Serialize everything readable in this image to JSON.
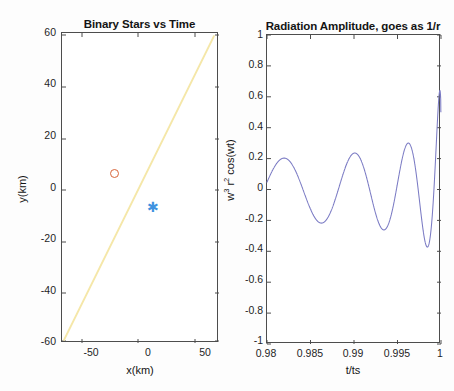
{
  "figure": {
    "background": "#ffffff",
    "frame_color": "#4d4d4d"
  },
  "panels": [
    {
      "id": "binary-stars",
      "title": "Binary Stars vs Time",
      "xlabel": "x(km)",
      "ylabel": "y(km)",
      "xticks": [
        "-50",
        "0",
        "50"
      ],
      "xtick_values": [
        -50,
        0,
        50
      ],
      "yticks": [
        "60",
        "40",
        "20",
        "0",
        "-20",
        "-40",
        "-60"
      ],
      "ytick_values": [
        60,
        40,
        20,
        0,
        -20,
        -40,
        -60
      ],
      "xlim": [
        -60,
        58
      ],
      "ylim": [
        -60,
        60
      ],
      "series": [
        {
          "name": "orbit-trace",
          "type": "line",
          "color": "#f5e7a8"
        },
        {
          "name": "star-1",
          "type": "marker",
          "marker": "circle",
          "color": "#d8653a",
          "x": -15,
          "y": 6
        },
        {
          "name": "star-2",
          "type": "marker",
          "marker": "asterisk",
          "color": "#3f93e0",
          "x": 14,
          "y": -6
        }
      ]
    },
    {
      "id": "radiation-amplitude",
      "title": "Radiation Amplitude, goes as 1/r",
      "xlabel": "t/ts",
      "ylabel_parts": {
        "base1": "w",
        "exp1": "3",
        "base2": " r",
        "exp2": "2",
        "rest": " cos(wt)"
      },
      "ylabel": "w3 r2 cos(wt)",
      "xticks": [
        "0.98",
        "0.985",
        "0.99",
        "0.995",
        "1"
      ],
      "xtick_values": [
        0.98,
        0.985,
        0.99,
        0.995,
        1.0
      ],
      "yticks": [
        "1",
        "0.8",
        "0.6",
        "0.4",
        "0.2",
        "0",
        "-0.2",
        "-0.4",
        "-0.6",
        "-0.8",
        "-1"
      ],
      "ytick_values": [
        1,
        0.8,
        0.6,
        0.4,
        0.2,
        0,
        -0.2,
        -0.4,
        -0.6,
        -0.8,
        -1
      ],
      "xlim": [
        0.98,
        1.0
      ],
      "ylim": [
        -1,
        1
      ],
      "series": [
        {
          "name": "chirp-waveform",
          "type": "line",
          "color": "#7b7bc4"
        }
      ]
    }
  ],
  "chart_data": [
    {
      "type": "scatter",
      "title": "Binary Stars vs Time",
      "xlabel": "x(km)",
      "ylabel": "y(km)",
      "xlim": [
        -60,
        58
      ],
      "ylim": [
        -60,
        60
      ],
      "grid": false,
      "legend": "none",
      "xticks": [
        -50,
        0,
        50
      ],
      "yticks": [
        -60,
        -40,
        -20,
        0,
        20,
        40,
        60
      ],
      "series": [
        {
          "name": "separation-line",
          "type": "line",
          "color": "#f5e7a8",
          "x": [
            -58,
            55
          ],
          "y": [
            -58,
            58
          ]
        },
        {
          "name": "star-1-circle",
          "type": "scatter",
          "color": "#d8653a",
          "marker": "o",
          "x": [
            -15
          ],
          "y": [
            6
          ]
        },
        {
          "name": "star-2-asterisk",
          "type": "scatter",
          "color": "#3f93e0",
          "marker": "*",
          "x": [
            14
          ],
          "y": [
            -6
          ]
        }
      ]
    },
    {
      "type": "line",
      "title": "Radiation Amplitude, goes as 1/r",
      "xlabel": "t/ts",
      "ylabel": "w^3 r^2 cos(wt)",
      "xlim": [
        0.98,
        1.0
      ],
      "ylim": [
        -1,
        1
      ],
      "grid": false,
      "legend": "none",
      "xticks": [
        0.98,
        0.985,
        0.99,
        0.995,
        1.0
      ],
      "yticks": [
        -1,
        -0.8,
        -0.6,
        -0.4,
        -0.2,
        0,
        0.2,
        0.4,
        0.6,
        0.8,
        1
      ],
      "description": "Inspiral chirp: amplitude and frequency both increase monotonically toward t/ts = 1 (merger).",
      "series": [
        {
          "name": "chirp-waveform",
          "color": "#7b7bc4",
          "peaks_t": [
            0.98,
            0.9825,
            0.988,
            0.9913,
            0.9938,
            0.9956,
            0.9969,
            0.9978,
            0.9985,
            0.999,
            0.9994,
            0.9997,
            0.9999
          ],
          "peaks_y": [
            0.3,
            0.35,
            0.4,
            0.47,
            0.53,
            0.61,
            0.69,
            0.77,
            0.85,
            0.9,
            0.94,
            0.97,
            1.0
          ],
          "troughs_t": [
            0.9838,
            0.9896,
            0.9926,
            0.9948,
            0.9963,
            0.9974,
            0.9982,
            0.9988,
            0.9992,
            0.9996,
            0.9998
          ],
          "troughs_y": [
            -0.37,
            -0.43,
            -0.49,
            -0.57,
            -0.65,
            -0.73,
            -0.8,
            -0.86,
            -0.91,
            -0.95,
            -0.99
          ]
        }
      ]
    }
  ]
}
